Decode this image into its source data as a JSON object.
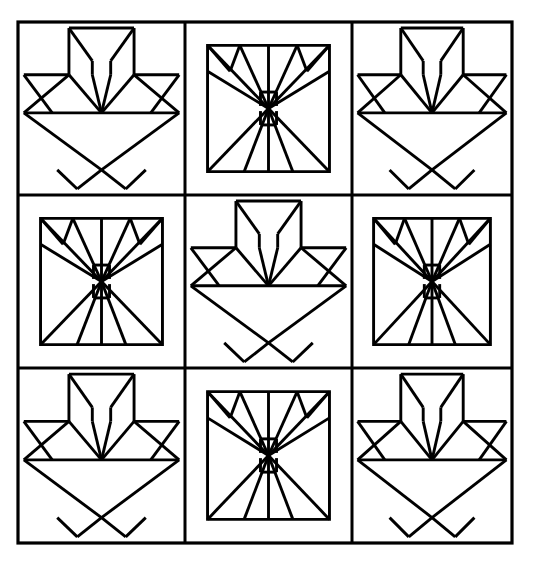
{
  "document": {
    "title": "Patchwork Quilt Block Line Drawing",
    "kind": "line-art-illustration",
    "width": 536,
    "height": 561,
    "background_color": "#ffffff",
    "ink_color": "#000000"
  },
  "canvas": {
    "frame": {
      "x": 18,
      "y": 22,
      "width": 494,
      "height": 521,
      "stroke_width": 3.2,
      "label": "outer-border"
    },
    "grid": {
      "columns": 3,
      "rows": 3,
      "column_edges": [
        18,
        185,
        352,
        512
      ],
      "row_edges": [
        22,
        195,
        368,
        543
      ],
      "divider_stroke_width": 3.0
    }
  },
  "blocks": [
    {
      "row": 0,
      "col": 0,
      "pattern": "tulip",
      "name": "block-tulip-top-left"
    },
    {
      "row": 0,
      "col": 1,
      "pattern": "butterfly",
      "name": "block-butterfly-top-center"
    },
    {
      "row": 0,
      "col": 2,
      "pattern": "tulip",
      "name": "block-tulip-top-right"
    },
    {
      "row": 1,
      "col": 0,
      "pattern": "butterfly",
      "name": "block-butterfly-middle-left"
    },
    {
      "row": 1,
      "col": 1,
      "pattern": "tulip",
      "name": "block-tulip-middle-center"
    },
    {
      "row": 1,
      "col": 2,
      "pattern": "butterfly",
      "name": "block-butterfly-middle-right"
    },
    {
      "row": 2,
      "col": 0,
      "pattern": "tulip",
      "name": "block-tulip-bottom-left"
    },
    {
      "row": 2,
      "col": 1,
      "pattern": "butterfly",
      "name": "block-butterfly-bottom-center"
    },
    {
      "row": 2,
      "col": 2,
      "pattern": "tulip",
      "name": "block-tulip-bottom-right"
    }
  ],
  "patterns": {
    "tulip": {
      "description": "Three-petal tulip flower above an inverted-triangle basket with corner feet",
      "inset": 0.0,
      "stroke_width": 2.9,
      "geometry_notes": {
        "petal_apex": [
          0.5,
          0.52
        ],
        "petal_top_y": 0.02,
        "leaf_band_y": 0.3,
        "basket_top_y": 0.52,
        "basket_foot_y": 0.86
      }
    },
    "butterfly": {
      "description": "Inset square containing a radial fan of wedges converging at center, with a narrow body bar above and below center",
      "inset": 0.135,
      "stroke_width": 2.9,
      "geometry_notes": {
        "center": [
          0.5,
          0.5
        ],
        "body_half_width": 0.055,
        "body_gap": 0.105
      }
    }
  },
  "legend": {
    "pattern_a_label": "Tulip / Basket",
    "pattern_b_label": "Butterfly / Fan",
    "arrangement_label": "3 x 3 checkerboard"
  }
}
